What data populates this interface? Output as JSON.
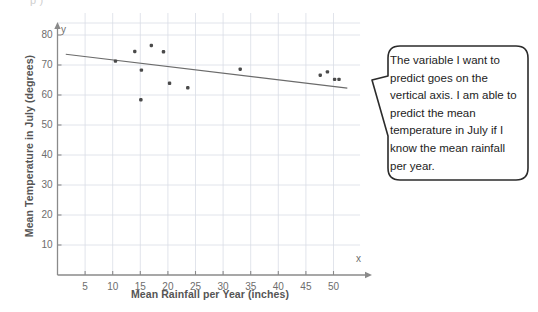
{
  "page": {
    "background": "#ffffff",
    "top_fragment": "p                       )"
  },
  "chart_data": {
    "type": "scatter",
    "title": "",
    "xlabel": "Mean Rainfall per Year (inches)",
    "ylabel": "Mean Temperature in July (degrees)",
    "x_axis_letter": "x",
    "y_axis_letter": "y",
    "xlim": [
      0,
      53
    ],
    "ylim": [
      0,
      84
    ],
    "xticks": [
      5,
      10,
      15,
      20,
      25,
      30,
      35,
      40,
      45,
      50
    ],
    "yticks": [
      10,
      20,
      30,
      40,
      50,
      60,
      70,
      80
    ],
    "grid": true,
    "grid_color": "#d9dde6",
    "point_color": "#4a4a4a",
    "trendline_color": "#6b6b6b",
    "axis_color": "#8a8a8a",
    "points": [
      {
        "x": 10.5,
        "y": 71.3
      },
      {
        "x": 14.0,
        "y": 74.5
      },
      {
        "x": 15.2,
        "y": 68.3
      },
      {
        "x": 15.1,
        "y": 58.4
      },
      {
        "x": 17.0,
        "y": 76.5
      },
      {
        "x": 19.2,
        "y": 74.4
      },
      {
        "x": 20.3,
        "y": 63.9
      },
      {
        "x": 23.6,
        "y": 62.4
      },
      {
        "x": 33.1,
        "y": 68.6
      },
      {
        "x": 47.6,
        "y": 66.6
      },
      {
        "x": 48.9,
        "y": 67.7
      },
      {
        "x": 50.2,
        "y": 65.2
      },
      {
        "x": 51.0,
        "y": 65.2
      }
    ],
    "trendline": {
      "x_start": 1.5,
      "y_start": 73.6,
      "x_end": 52.5,
      "y_end": 62.3
    }
  },
  "callout": {
    "text": "The variable I want to predict goes on the vertical axis.  I am able to predict the mean temperature in July if I know the mean rainfall per year.",
    "border_color": "#2b2b2b",
    "fill_color": "#ffffff"
  }
}
